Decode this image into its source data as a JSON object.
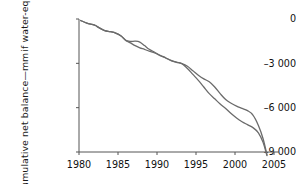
{
  "chart_data": {
    "type": "line",
    "title": "",
    "xlabel": "",
    "ylabel_line1": "Mean cumulative net balance—mm",
    "ylabel_line2": "if water-equivalent",
    "xlim": [
      1980,
      2005
    ],
    "ylim": [
      -9000,
      0
    ],
    "grid": false,
    "legend": "none",
    "xticks": [
      "1980",
      "1985",
      "1990",
      "1995",
      "2000",
      "2005"
    ],
    "xtick_values": [
      1980,
      1985,
      1990,
      1995,
      2000,
      2005
    ],
    "yticks": [
      "0",
      "–3 000",
      "–6 000",
      "–9 000"
    ],
    "ytick_values": [
      0,
      -3000,
      -6000,
      -9000
    ],
    "line_color": "#6b6b6b",
    "axis_color": "#555555",
    "series": [
      {
        "name": "series-a",
        "x": [
          1980.2,
          1981.0,
          1982.0,
          1982.6,
          1983.3,
          1984.0,
          1984.7,
          1985.4,
          1986.0,
          1986.6,
          1987.2,
          1987.8,
          1988.4,
          1989.0,
          1989.7,
          1990.4,
          1991.1,
          1991.8,
          1992.5,
          1993.2,
          1993.9,
          1994.6,
          1995.3,
          1996.0,
          1996.7,
          1997.4,
          1998.1,
          1998.8,
          1999.5,
          2000.2,
          2000.9,
          2001.6,
          2002.3,
          2003.0,
          2003.6,
          2004.1
        ],
        "y": [
          -100,
          -280,
          -420,
          -600,
          -790,
          -860,
          -950,
          -1150,
          -1450,
          -1520,
          -1500,
          -1560,
          -1800,
          -2050,
          -2250,
          -2450,
          -2620,
          -2800,
          -2920,
          -3020,
          -3200,
          -3500,
          -3800,
          -4050,
          -4250,
          -4600,
          -5050,
          -5450,
          -5700,
          -5900,
          -6050,
          -6200,
          -6500,
          -7200,
          -8100,
          -9200
        ]
      },
      {
        "name": "series-b",
        "x": [
          1980.2,
          1981.0,
          1982.0,
          1982.6,
          1983.3,
          1984.0,
          1984.7,
          1985.4,
          1986.0,
          1986.6,
          1987.2,
          1987.8,
          1988.4,
          1989.0,
          1989.7,
          1990.4,
          1991.1,
          1991.8,
          1992.5,
          1993.2,
          1993.9,
          1994.6,
          1995.3,
          1996.0,
          1996.7,
          1997.4,
          1998.1,
          1998.8,
          1999.5,
          2000.2,
          2000.9,
          2001.6,
          2002.3,
          2003.0,
          2003.6,
          2004.1
        ],
        "y": [
          -100,
          -280,
          -420,
          -600,
          -790,
          -860,
          -950,
          -1150,
          -1450,
          -1620,
          -1800,
          -1950,
          -2050,
          -2180,
          -2300,
          -2480,
          -2640,
          -2810,
          -2930,
          -3030,
          -3350,
          -3750,
          -4150,
          -4600,
          -5050,
          -5400,
          -5750,
          -6050,
          -6400,
          -6700,
          -6950,
          -7150,
          -7350,
          -7700,
          -8350,
          -9250
        ]
      }
    ]
  }
}
